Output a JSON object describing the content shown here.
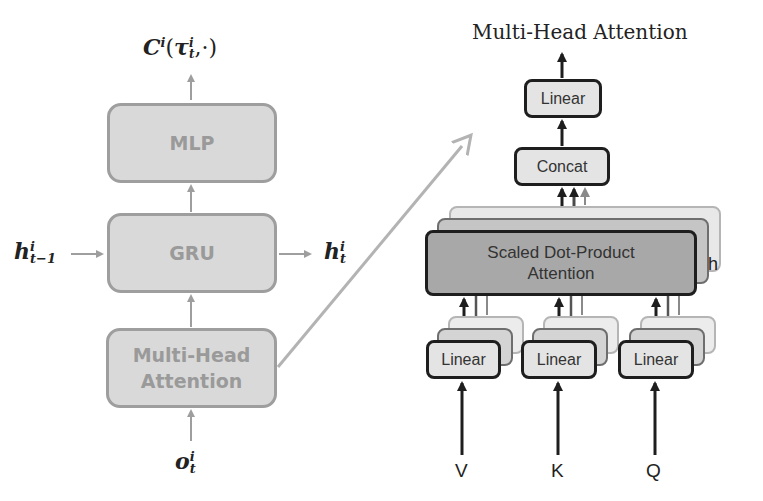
{
  "left_diagram": {
    "output_label": {
      "base": "C",
      "sup": "i",
      "open": "(",
      "tau": "τ",
      "tau_sup": "i",
      "tau_sub": "t",
      "rest": ",·)"
    },
    "boxes": [
      {
        "id": "mlp",
        "label": "MLP"
      },
      {
        "id": "gru",
        "label": "GRU"
      },
      {
        "id": "mha",
        "label_line1": "Multi-Head",
        "label_line2": "Attention"
      }
    ],
    "hidden_in": {
      "base": "h",
      "sup": "i",
      "sub": "t−1"
    },
    "hidden_out": {
      "base": "h",
      "sup": "i",
      "sub": "t"
    },
    "observation": {
      "base": "o",
      "sup": "i",
      "sub": "t"
    },
    "box_fill": "#d9d9d9",
    "box_border": "#9e9e9e",
    "text_color": "#9a9a9a"
  },
  "right_diagram": {
    "title": "Multi-Head Attention",
    "linear_top": "Linear",
    "concat": "Concat",
    "sdpa_line1": "Scaled Dot-Product",
    "sdpa_line2": "Attention",
    "heads_label": "h",
    "linear_inputs": [
      "Linear",
      "Linear",
      "Linear"
    ],
    "inputs": [
      "V",
      "K",
      "Q"
    ],
    "box_fill": "#e4e4e4",
    "sdpa_fill": "#a8a8a8",
    "border": "#1e1e1e"
  },
  "connector_color": "#b3b3b3"
}
